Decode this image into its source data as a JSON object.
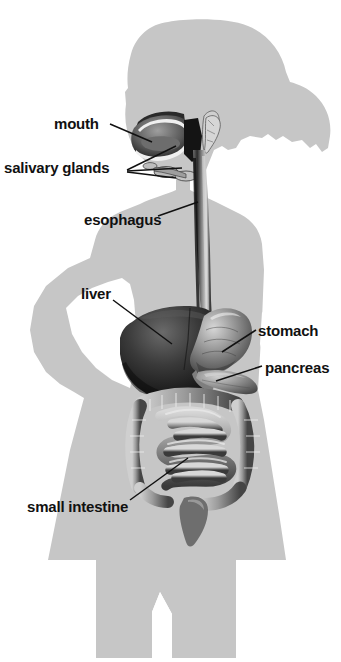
{
  "diagram": {
    "background_color": "#ffffff",
    "silhouette_color": "#c6c6c6",
    "label_color": "#111111",
    "labels": [
      {
        "id": "mouth",
        "text": "mouth",
        "x": 54,
        "y": 115
      },
      {
        "id": "salivary-glands",
        "text": "salivary glands",
        "x": 4,
        "y": 159
      },
      {
        "id": "esophagus",
        "text": "esophagus",
        "x": 84,
        "y": 211
      },
      {
        "id": "liver",
        "text": "liver",
        "x": 81,
        "y": 285
      },
      {
        "id": "stomach",
        "text": "stomach",
        "x": 258,
        "y": 322
      },
      {
        "id": "pancreas",
        "text": "pancreas",
        "x": 265,
        "y": 359
      },
      {
        "id": "small-intestine",
        "text": "small intestine",
        "x": 27,
        "y": 498
      }
    ],
    "organs": [
      {
        "id": "mouth-cavity",
        "name": "mouth"
      },
      {
        "id": "salivary-glands",
        "name": "salivary glands"
      },
      {
        "id": "esophagus",
        "name": "esophagus"
      },
      {
        "id": "liver",
        "name": "liver"
      },
      {
        "id": "stomach",
        "name": "stomach"
      },
      {
        "id": "pancreas",
        "name": "pancreas"
      },
      {
        "id": "small-intestine",
        "name": "small intestine"
      },
      {
        "id": "large-intestine",
        "name": "large intestine"
      },
      {
        "id": "rectum",
        "name": "rectum"
      }
    ]
  }
}
